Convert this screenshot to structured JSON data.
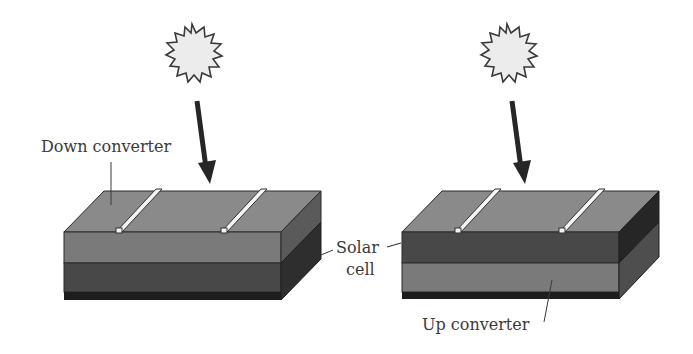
{
  "figure": {
    "panels": [
      {
        "id": "down-conversion",
        "labels": {
          "top_layer": "Down converter",
          "side_label_line1": "Solar",
          "side_label_line2": "cell"
        },
        "layers_top_to_bottom": [
          "Down converter",
          "Solar cell"
        ],
        "colors": {
          "top_layer": "#7a7a7a",
          "bottom_layer": "#484848",
          "base_strip": "#1e1e1e"
        }
      },
      {
        "id": "up-conversion",
        "labels": {
          "bottom_layer": "Up converter"
        },
        "layers_top_to_bottom": [
          "Solar cell",
          "Up converter"
        ],
        "colors": {
          "top_layer": "#484848",
          "bottom_layer": "#7a7a7a",
          "base_strip": "#1e1e1e"
        }
      }
    ],
    "icons": [
      "sun-icon",
      "light-arrow-icon",
      "contact-finger"
    ],
    "colors": {
      "sun_fill": "#ececec",
      "sun_stroke": "#3a3a3a",
      "arrow": "#262626",
      "top_surface_light": "#8a8a8a",
      "finger": "#f4f4f4"
    }
  }
}
